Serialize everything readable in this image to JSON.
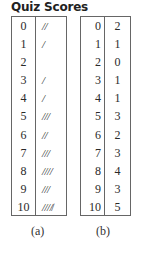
{
  "title": "Quiz Scores",
  "tables": {
    "a": {
      "caption": "(a)",
      "rows": [
        {
          "score": "0",
          "tally": "//"
        },
        {
          "score": "1",
          "tally": "/"
        },
        {
          "score": "2",
          "tally": ""
        },
        {
          "score": "3",
          "tally": "/"
        },
        {
          "score": "4",
          "tally": "/"
        },
        {
          "score": "5",
          "tally": "///"
        },
        {
          "score": "6",
          "tally": "//"
        },
        {
          "score": "7",
          "tally": "///"
        },
        {
          "score": "8",
          "tally": "////"
        },
        {
          "score": "9",
          "tally": "///"
        },
        {
          "score": "10",
          "tally": "////̸"
        }
      ]
    },
    "b": {
      "caption": "(b)",
      "rows": [
        {
          "score": "0",
          "freq": "2"
        },
        {
          "score": "1",
          "freq": "1"
        },
        {
          "score": "2",
          "freq": "0"
        },
        {
          "score": "3",
          "freq": "1"
        },
        {
          "score": "4",
          "freq": "1"
        },
        {
          "score": "5",
          "freq": "3"
        },
        {
          "score": "6",
          "freq": "2"
        },
        {
          "score": "7",
          "freq": "3"
        },
        {
          "score": "8",
          "freq": "4"
        },
        {
          "score": "9",
          "freq": "3"
        },
        {
          "score": "10",
          "freq": "5"
        }
      ]
    }
  },
  "chart_data": {
    "type": "table",
    "title": "Quiz Scores",
    "tables": [
      {
        "caption": "(a)",
        "columns": [
          "Score",
          "Tally"
        ],
        "categories": [
          "0",
          "1",
          "2",
          "3",
          "4",
          "5",
          "6",
          "7",
          "8",
          "9",
          "10"
        ],
        "tallies": [
          "//",
          "/",
          "",
          "/",
          "/",
          "///",
          "//",
          "///",
          "////",
          "///",
          "////̸"
        ]
      },
      {
        "caption": "(b)",
        "columns": [
          "Score",
          "Frequency"
        ],
        "categories": [
          "0",
          "1",
          "2",
          "3",
          "4",
          "5",
          "6",
          "7",
          "8",
          "9",
          "10"
        ],
        "values": [
          2,
          1,
          0,
          1,
          1,
          3,
          2,
          3,
          4,
          3,
          5
        ]
      }
    ]
  }
}
